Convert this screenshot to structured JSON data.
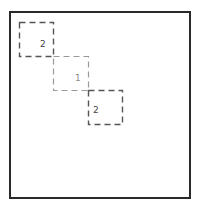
{
  "diagram": {
    "frame": {
      "left": 9,
      "top": 11,
      "right": 191,
      "bottom": 199,
      "border_color": "#2a2a2a"
    },
    "boxes": [
      {
        "id": "box-a",
        "label": "2",
        "x": 19,
        "y": 22,
        "size": 34,
        "stroke": "#555555",
        "label_x": 40,
        "label_y": 40,
        "label_color": "#444444"
      },
      {
        "id": "box-b",
        "label": "1",
        "x": 53,
        "y": 56,
        "size": 34,
        "stroke": "#9a9a9a",
        "label_x": 75,
        "label_y": 74,
        "label_color": "#8a8a8a"
      },
      {
        "id": "box-c",
        "label": "2",
        "x": 88,
        "y": 90,
        "size": 34,
        "stroke": "#555555",
        "label_x": 93,
        "label_y": 106,
        "label_color": "#444444"
      }
    ]
  }
}
